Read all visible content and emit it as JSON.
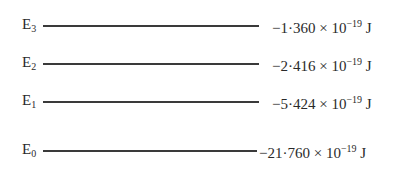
{
  "diagram": {
    "title": "",
    "levels": [
      {
        "symbol": "E",
        "subscript": "3",
        "mantissa": "−1·360",
        "times": " × 10",
        "exponent": "−19",
        "unit": " J"
      },
      {
        "symbol": "E",
        "subscript": "2",
        "mantissa": "−2·416",
        "times": " × 10",
        "exponent": "−19",
        "unit": " J"
      },
      {
        "symbol": "E",
        "subscript": "1",
        "mantissa": "−5·424",
        "times": " × 10",
        "exponent": "−19",
        "unit": " J"
      },
      {
        "symbol": "E",
        "subscript": "0",
        "mantissa": "−21·760",
        "times": " × 10",
        "exponent": "−19",
        "unit": " J"
      }
    ]
  }
}
